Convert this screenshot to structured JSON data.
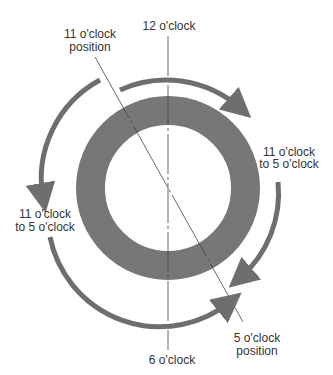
{
  "diagram": {
    "labels": {
      "twelve": "12 o'clock",
      "six": "6 o'clock",
      "eleven_line1": "11 o'clock",
      "eleven_line2": "position",
      "five_line1": "5 o'clock",
      "five_line2": "position",
      "right_arc_line1": "11 o'clock",
      "right_arc_line2": "to 5 o'clock",
      "left_arc_line1": "11 o'clock",
      "left_arc_line2": "to 5 o'clock"
    },
    "colors": {
      "ring": "#777777",
      "arrow": "#6e6e6e",
      "axis": "#444444",
      "text": "#333333"
    }
  }
}
